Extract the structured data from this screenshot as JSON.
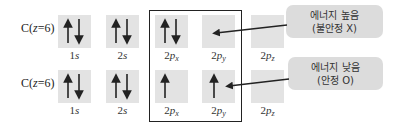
{
  "rows": [
    {
      "element_label": "C(z=6)",
      "element_prefix": "C(",
      "element_var": "z",
      "element_suffix": "=6)",
      "orbitals": [
        {
          "name": "1s",
          "num": "1",
          "sub_main": "s",
          "sub": "",
          "electrons": [
            "up",
            "down"
          ]
        },
        {
          "name": "2s",
          "num": "2",
          "sub_main": "s",
          "sub": "",
          "electrons": [
            "up",
            "down"
          ]
        },
        {
          "name": "2px",
          "num": "2",
          "sub_main": "p",
          "sub": "x",
          "electrons": [
            "up",
            "down"
          ]
        },
        {
          "name": "2py",
          "num": "2",
          "sub_main": "p",
          "sub": "y",
          "electrons": []
        },
        {
          "name": "2pz",
          "num": "2",
          "sub_main": "p",
          "sub": "z",
          "electrons": []
        }
      ]
    },
    {
      "element_label": "C(z=6)",
      "element_prefix": "C(",
      "element_var": "z",
      "element_suffix": "=6)",
      "orbitals": [
        {
          "name": "1s",
          "num": "1",
          "sub_main": "s",
          "sub": "",
          "electrons": [
            "up",
            "down"
          ]
        },
        {
          "name": "2s",
          "num": "2",
          "sub_main": "s",
          "sub": "",
          "electrons": [
            "up",
            "down"
          ]
        },
        {
          "name": "2px",
          "num": "2",
          "sub_main": "p",
          "sub": "x",
          "electrons": [
            "up"
          ]
        },
        {
          "name": "2py",
          "num": "2",
          "sub_main": "p",
          "sub": "y",
          "electrons": [
            "up"
          ]
        },
        {
          "name": "2pz",
          "num": "2",
          "sub_main": "p",
          "sub": "z",
          "electrons": []
        }
      ]
    }
  ],
  "callouts": [
    {
      "line1": "에너지 높음",
      "line2": "(불안정 X)"
    },
    {
      "line1": "에너지 낮음",
      "line2": "(안정 O)"
    }
  ],
  "colors": {
    "box": "#e3e3e3",
    "bubble": "#dcdcdc",
    "ink": "#222222"
  }
}
